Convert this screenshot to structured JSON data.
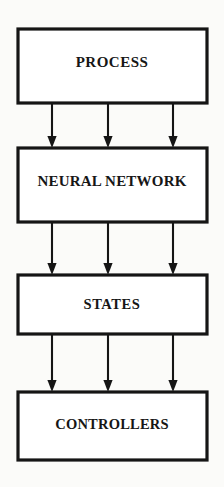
{
  "diagram": {
    "type": "flow-block-diagram",
    "orientation": "vertical-top-to-bottom",
    "background_color": "#fbfbf9",
    "line_color": "#151515",
    "box_fill_color": "#ffffff",
    "blocks": [
      {
        "id": "process",
        "label": "PROCESS",
        "order": 1,
        "x": 18,
        "y": 29,
        "width": 189,
        "height": 74
      },
      {
        "id": "neural",
        "label": "NEURAL NETWORK",
        "order": 2,
        "x": 18,
        "y": 148,
        "width": 189,
        "height": 74
      },
      {
        "id": "states",
        "label": "STATES",
        "order": 3,
        "x": 18,
        "y": 275,
        "width": 189,
        "height": 59
      },
      {
        "id": "controllers",
        "label": "CONTROLLERS",
        "order": 4,
        "x": 18,
        "y": 392,
        "width": 189,
        "height": 68
      }
    ],
    "connector_groups": [
      {
        "id": "process-to-neural",
        "from": "process",
        "to": "neural",
        "arrow_count": 3,
        "direction": "down",
        "x_positions": [
          52,
          108,
          173
        ],
        "y_start": 103,
        "y_end": 148
      },
      {
        "id": "neural-to-states",
        "from": "neural",
        "to": "states",
        "arrow_count": 3,
        "direction": "down",
        "x_positions": [
          52,
          108,
          173
        ],
        "y_start": 222,
        "y_end": 275
      },
      {
        "id": "states-to-controllers",
        "from": "states",
        "to": "controllers",
        "arrow_count": 3,
        "direction": "down",
        "x_positions": [
          52,
          108,
          173
        ],
        "y_start": 334,
        "y_end": 392
      }
    ]
  }
}
